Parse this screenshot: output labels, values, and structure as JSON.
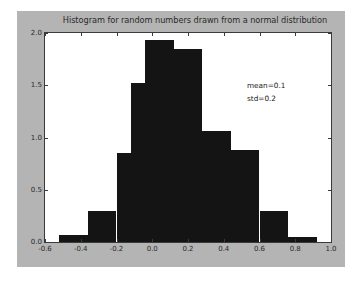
{
  "figure": {
    "background_color": "#b4b4b4",
    "axes_background_color": "#ffffff",
    "bar_color": "#141414",
    "axis_color": "#3a3a3a"
  },
  "chart_data": {
    "type": "bar",
    "title": "Histogram for random numbers drawn from a normal distribution",
    "xlabel": "",
    "ylabel": "",
    "xlim": [
      -0.6,
      1.0
    ],
    "ylim": [
      0.0,
      2.0
    ],
    "grid": false,
    "legend_position": "none",
    "xticks": [
      "-0.6",
      "-0.4",
      "-0.2",
      "0.0",
      "0.2",
      "0.4",
      "0.6",
      "0.8",
      "1.0"
    ],
    "xtick_values": [
      -0.6,
      -0.4,
      -0.2,
      0.0,
      0.2,
      0.4,
      0.6,
      0.8,
      1.0
    ],
    "yticks": [
      "0.0",
      "0.5",
      "1.0",
      "1.5",
      "2.0"
    ],
    "ytick_values": [
      0.0,
      0.5,
      1.0,
      1.5,
      2.0
    ],
    "bin_edges": [
      -0.52,
      -0.44,
      -0.36,
      -0.28,
      -0.2,
      -0.12,
      -0.04,
      0.04,
      0.12,
      0.2,
      0.28,
      0.36,
      0.44,
      0.52,
      0.6,
      0.68,
      0.76,
      0.84,
      0.92
    ],
    "bin_centers": [
      -0.48,
      -0.4,
      -0.32,
      -0.24,
      -0.16,
      -0.08,
      0.0,
      0.08,
      0.16,
      0.24,
      0.32,
      0.4,
      0.48,
      0.56,
      0.64,
      0.72,
      0.8,
      0.88
    ],
    "values": [
      0.07,
      0.07,
      0.3,
      0.3,
      0.85,
      1.52,
      1.93,
      1.93,
      1.85,
      1.85,
      1.06,
      1.06,
      0.88,
      0.88,
      0.3,
      0.3,
      0.05,
      0.05,
      0.02
    ],
    "annotations": [
      {
        "text": "mean=0.1",
        "x": 0.44,
        "y": 1.66
      },
      {
        "text": "std=0.2",
        "x": 0.44,
        "y": 1.55
      }
    ]
  },
  "annotation_lines": {
    "mean": "mean=0.1",
    "std": "std=0.2"
  }
}
